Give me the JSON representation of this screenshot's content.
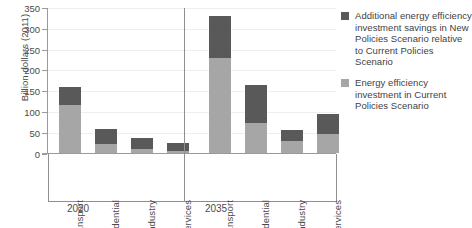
{
  "chart_data": {
    "type": "bar",
    "subtype": "stacked-grouped",
    "title": "",
    "xlabel": "",
    "ylabel": "Billion dollars (2011)",
    "ylim": [
      0,
      350
    ],
    "ytick_step": 50,
    "ytick_labels": [
      "0",
      "50",
      "100",
      "150",
      "200",
      "250",
      "300",
      "350"
    ],
    "grid": true,
    "legend_position": "right",
    "groups": [
      {
        "label": "2020",
        "categories": [
          "Transport",
          "Residential",
          "Industry",
          "Services"
        ]
      },
      {
        "label": "2035",
        "categories": [
          "Transport",
          "Residential",
          "Industry",
          "Services"
        ]
      }
    ],
    "categories": [
      "Transport",
      "Residential",
      "Industry",
      "Services"
    ],
    "series": [
      {
        "name": "Energy efficiency investment in Current Policies Scenario",
        "color": "#a6a6a6",
        "values_2020": [
          115,
          21,
          9,
          4
        ],
        "values_2035": [
          230,
          72,
          30,
          45
        ]
      },
      {
        "name": "Additional energy efficiency investment savings in New Policies Scenario relative to Current Policies Scenario",
        "color": "#595959",
        "values_2020": [
          45,
          37,
          27,
          21
        ],
        "values_2035": [
          100,
          93,
          26,
          50
        ]
      }
    ],
    "totals_2020": [
      160,
      58,
      36,
      25
    ],
    "totals_2035": [
      330,
      165,
      56,
      95
    ],
    "bars": [
      {
        "group": "2020",
        "category": "Transport",
        "base": 115,
        "additional": 45,
        "total": 160
      },
      {
        "group": "2020",
        "category": "Residential",
        "base": 21,
        "additional": 37,
        "total": 58
      },
      {
        "group": "2020",
        "category": "Industry",
        "base": 9,
        "additional": 27,
        "total": 36
      },
      {
        "group": "2020",
        "category": "Services",
        "base": 4,
        "additional": 21,
        "total": 25
      },
      {
        "group": "2035",
        "category": "Transport",
        "base": 230,
        "additional": 100,
        "total": 330
      },
      {
        "group": "2035",
        "category": "Residential",
        "base": 72,
        "additional": 93,
        "total": 165
      },
      {
        "group": "2035",
        "category": "Industry",
        "base": 30,
        "additional": 26,
        "total": 56
      },
      {
        "group": "2035",
        "category": "Services",
        "base": 45,
        "additional": 50,
        "total": 95
      }
    ]
  },
  "axis": {
    "y_title": "Billion dollars (2011)",
    "y_ticks": [
      "350",
      "300",
      "250",
      "200",
      "150",
      "100",
      "50",
      "0"
    ]
  },
  "legend": {
    "entries": [
      {
        "color": "#595959",
        "label": "Additional energy efficiency investment savings in New Policies Scenario relative to Current Policies Scenario"
      },
      {
        "color": "#a6a6a6",
        "label": "Energy efficiency investment in Current Policies Scenario"
      }
    ]
  },
  "categories": {
    "g1": [
      "Transport",
      "Residential",
      "Industry",
      "Services"
    ],
    "g2": [
      "Transport",
      "Residential",
      "Industry",
      "Services"
    ]
  },
  "group_labels": {
    "first": "2020",
    "second": "2035"
  },
  "colors": {
    "base": "#a6a6a6",
    "additional": "#595959",
    "axis": "#9a9a9a",
    "grid": "#efefef",
    "text": "#4a4a4a"
  }
}
